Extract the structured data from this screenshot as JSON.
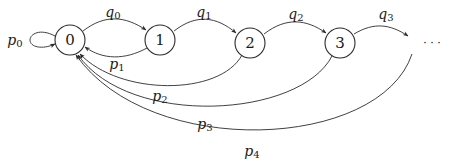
{
  "diagram": {
    "type": "state-transition-graph",
    "nodes": [
      {
        "id": "0",
        "label": "0",
        "cx": 70,
        "cy": 40
      },
      {
        "id": "1",
        "label": "1",
        "cx": 160,
        "cy": 40
      },
      {
        "id": "2",
        "label": "2",
        "cx": 250,
        "cy": 43
      },
      {
        "id": "3",
        "label": "3",
        "cx": 340,
        "cy": 43
      }
    ],
    "ellipsis": {
      "label": "· · ·",
      "x": 432,
      "y": 44
    },
    "edges": [
      {
        "from": "0",
        "to": "0",
        "label_base": "p",
        "label_sub": "0",
        "kind": "self-loop"
      },
      {
        "from": "0",
        "to": "1",
        "label_base": "q",
        "label_sub": "0"
      },
      {
        "from": "1",
        "to": "2",
        "label_base": "q",
        "label_sub": "1"
      },
      {
        "from": "2",
        "to": "3",
        "label_base": "q",
        "label_sub": "2"
      },
      {
        "from": "3",
        "to": "...",
        "label_base": "q",
        "label_sub": "3"
      },
      {
        "from": "1",
        "to": "0",
        "label_base": "p",
        "label_sub": "1"
      },
      {
        "from": "2",
        "to": "0",
        "label_base": "p",
        "label_sub": "2"
      },
      {
        "from": "3",
        "to": "0",
        "label_base": "p",
        "label_sub": "3"
      },
      {
        "from": "...",
        "to": "0",
        "label_base": "p",
        "label_sub": "4"
      }
    ],
    "colors": {
      "stroke": "#2b2b2b",
      "background": "#ffffff"
    }
  },
  "labels": {
    "node0": "0",
    "node1": "1",
    "node2": "2",
    "node3": "3",
    "ellipsis": "· · ·",
    "p0": {
      "base": "p",
      "sub": "0"
    },
    "q0": {
      "base": "q",
      "sub": "0"
    },
    "q1": {
      "base": "q",
      "sub": "1"
    },
    "q2": {
      "base": "q",
      "sub": "2"
    },
    "q3": {
      "base": "q",
      "sub": "3"
    },
    "p1": {
      "base": "p",
      "sub": "1"
    },
    "p2": {
      "base": "p",
      "sub": "2"
    },
    "p3": {
      "base": "p",
      "sub": "3"
    },
    "p4": {
      "base": "p",
      "sub": "4"
    }
  }
}
